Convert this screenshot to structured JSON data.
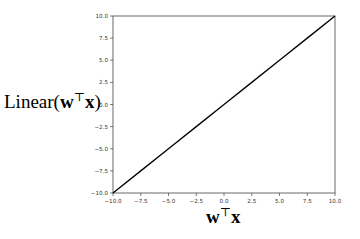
{
  "chart_data": {
    "type": "line",
    "title": "",
    "xlabel": "w^T x",
    "ylabel": "Linear(w^T x)",
    "xlim": [
      -10.0,
      10.0
    ],
    "ylim": [
      -10.0,
      10.0
    ],
    "xticks": [
      "-10.0",
      "-7.5",
      "-5.0",
      "-2.5",
      "0.0",
      "2.5",
      "5.0",
      "7.5",
      "10.0"
    ],
    "yticks": [
      "-10.0",
      "-7.5",
      "-5.0",
      "-2.5",
      "0.0",
      "2.5",
      "5.0",
      "7.5",
      "10.0"
    ],
    "grid": false,
    "legend": null,
    "series": [
      {
        "name": "Linear",
        "x": [
          -10.0,
          -7.5,
          -5.0,
          -2.5,
          0.0,
          2.5,
          5.0,
          7.5,
          10.0
        ],
        "y": [
          -10.0,
          -7.5,
          -5.0,
          -2.5,
          0.0,
          2.5,
          5.0,
          7.5,
          10.0
        ],
        "color": "#000000"
      }
    ]
  },
  "labels": {
    "y_prefix": "Linear(",
    "y_w": "w",
    "y_sup": "⊤",
    "y_x": "x",
    "y_suffix": ")",
    "x_w": "w",
    "x_sup": "⊤",
    "x_x": "x"
  }
}
